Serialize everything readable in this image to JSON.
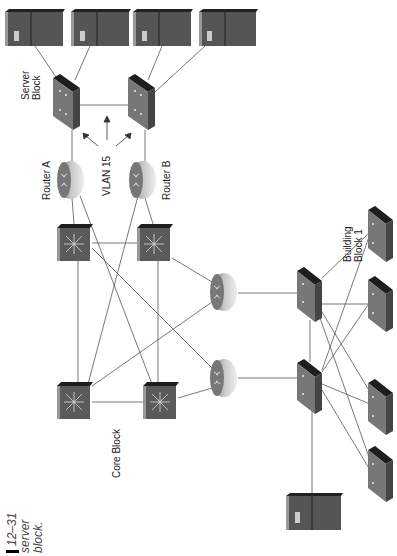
{
  "caption": {
    "figure_number": "12–31",
    "line1": "server",
    "line2": "block."
  },
  "labels": {
    "server_block": [
      "Server",
      "Block"
    ],
    "router_a": "Router A",
    "router_b": "Router B",
    "vlan": "VLAN 15",
    "core_block": "Core Block",
    "building_block": [
      "Building",
      "Block 1"
    ]
  },
  "colors": {
    "device_dark": "#4a4a4a",
    "device_side": "#3a3a3a",
    "device_top": "#222222",
    "link": "#555555"
  }
}
